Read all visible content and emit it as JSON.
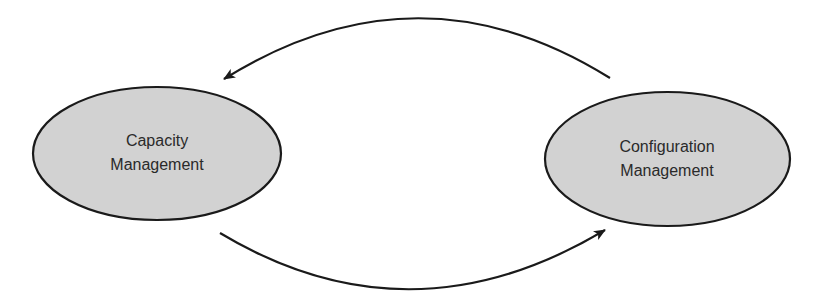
{
  "diagram": {
    "type": "cycle",
    "colors": {
      "background": "#ffffff",
      "node_fill": "#d2d2d2",
      "node_stroke": "#1a1a1a",
      "edge_stroke": "#1a1a1a",
      "text": "#2a2a2a"
    },
    "nodes": [
      {
        "id": "capacity-management",
        "shape": "ellipse",
        "label_lines": [
          "Capacity",
          "Management"
        ]
      },
      {
        "id": "configuration-management",
        "shape": "ellipse",
        "label_lines": [
          "Configuration",
          "Management"
        ]
      }
    ],
    "edges": [
      {
        "from": "configuration-management",
        "to": "capacity-management",
        "style": "curved-arrow-over-top"
      },
      {
        "from": "capacity-management",
        "to": "configuration-management",
        "style": "curved-arrow-under-bottom"
      }
    ]
  }
}
